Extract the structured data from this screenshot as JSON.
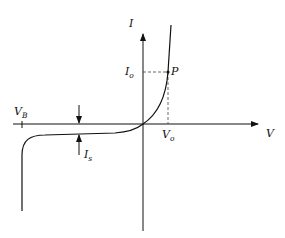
{
  "diagram": {
    "axes": {
      "x_label": "V",
      "y_label": "I"
    },
    "labels": {
      "breakdown_voltage": {
        "main": "V",
        "sub": "B"
      },
      "operating_current": {
        "main": "I",
        "sub": "o"
      },
      "operating_voltage": {
        "main": "V",
        "sub": "o"
      },
      "saturation_current": {
        "main": "I",
        "sub": "s"
      },
      "point": "P"
    },
    "colors": {
      "line": "#111111",
      "background": "#ffffff",
      "dashed": "#444444"
    }
  }
}
